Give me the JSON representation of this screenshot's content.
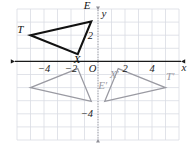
{
  "figure": {
    "background": "#ffffff",
    "grid": {
      "color": "#d9dce3",
      "xmin": -6,
      "xmax": 6,
      "ymin": -6,
      "ymax": 4,
      "step": 1,
      "visible": true
    },
    "axes": {
      "x": {
        "label": "x",
        "color": "#1a1a1a",
        "style": "solid",
        "arrows": "both",
        "ticks": [
          {
            "value": -4,
            "text": "−4"
          },
          {
            "value": -2,
            "text": "−2"
          },
          {
            "value": 0,
            "text": "O"
          },
          {
            "value": 2,
            "text": "2"
          },
          {
            "value": 4,
            "text": "4"
          }
        ]
      },
      "y": {
        "label": "y",
        "color": "#8e8e96",
        "style": "dotted",
        "arrows": "both",
        "ticks": [
          {
            "value": 2,
            "text": "2"
          },
          {
            "value": -4,
            "text": "−4"
          }
        ]
      }
    },
    "shapes": [
      {
        "name": "triangle-tex",
        "color": "#111111",
        "stroke_width": 2.1,
        "vertices": [
          {
            "label": "T",
            "x": -5.0,
            "y": 2.0,
            "label_dx": -0.75,
            "label_dy": 0.15
          },
          {
            "label": "E",
            "x": -0.5,
            "y": 3.05,
            "label_dx": -0.3,
            "label_dy": 0.95
          },
          {
            "label": "X",
            "x": -1.5,
            "y": 0.55,
            "label_dx": -0.05,
            "label_dy": -0.7
          }
        ]
      },
      {
        "name": "triangle-tex-reflected-left",
        "color": "#9a9aa2",
        "stroke_width": 1.3,
        "vertices": [
          {
            "label": "",
            "x": -5.0,
            "y": -2.0,
            "label_dx": 0,
            "label_dy": 0
          },
          {
            "label": "",
            "x": -0.5,
            "y": -3.05,
            "label_dx": 0,
            "label_dy": 0
          },
          {
            "label": "",
            "x": -1.5,
            "y": -0.55,
            "label_dx": 0,
            "label_dy": 0
          }
        ]
      },
      {
        "name": "triangle-tex-reflected-right",
        "color": "#9a9aa2",
        "stroke_width": 1.3,
        "vertices": [
          {
            "label": "T′",
            "x": 5.0,
            "y": -2.0,
            "label_dx": 0.35,
            "label_dy": 0.6
          },
          {
            "label": "E′",
            "x": 0.5,
            "y": -3.05,
            "label_dx": -0.15,
            "label_dy": 0.95
          },
          {
            "label": "X′",
            "x": 1.5,
            "y": -0.55,
            "label_dx": -0.3,
            "label_dy": -0.75
          }
        ]
      }
    ]
  }
}
